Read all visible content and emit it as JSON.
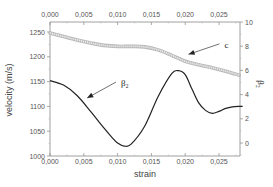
{
  "chart_data": {
    "type": "line",
    "title": "",
    "xlabel": "strain",
    "ylabel": "velocity (m/s)",
    "y2label": "β₂",
    "xlim": [
      0,
      0.0285
    ],
    "ylim": [
      1000,
      1270
    ],
    "y2lim": [
      -1,
      10
    ],
    "xticks": [
      0.0,
      0.005,
      0.01,
      0.015,
      0.02,
      0.025
    ],
    "xtick_labels": [
      "0,000",
      "0,005",
      "0,010",
      "0,015",
      "0,020",
      "0,025"
    ],
    "yticks": [
      1000,
      1050,
      1100,
      1150,
      1200,
      1250
    ],
    "ytick_labels": [
      "1000",
      "1050",
      "1100",
      "1150",
      "1200",
      "1250"
    ],
    "y2ticks": [
      0,
      2,
      4,
      6,
      8,
      10
    ],
    "y2tick_labels": [
      "0",
      "2",
      "4",
      "6",
      "8",
      "10"
    ],
    "grid": false,
    "series": [
      {
        "name": "c",
        "axis": "left",
        "color": "#c8c8c8",
        "style": "thick-hollow",
        "x": [
          0.0,
          0.002,
          0.004,
          0.006,
          0.008,
          0.01,
          0.012,
          0.014,
          0.016,
          0.018,
          0.02,
          0.022,
          0.024,
          0.026,
          0.028
        ],
        "y": [
          1248,
          1241,
          1234,
          1228,
          1223,
          1221,
          1221,
          1220,
          1214,
          1203,
          1191,
          1184,
          1178,
          1171,
          1163
        ]
      },
      {
        "name": "β₂",
        "axis": "left",
        "color": "#222222",
        "style": "solid",
        "x": [
          0.0,
          0.002,
          0.004,
          0.006,
          0.008,
          0.009,
          0.01,
          0.011,
          0.012,
          0.014,
          0.016,
          0.018,
          0.019,
          0.02,
          0.021,
          0.022,
          0.023,
          0.024,
          0.025,
          0.026,
          0.027,
          0.028,
          0.0285
        ],
        "y": [
          1152,
          1143,
          1122,
          1090,
          1056,
          1040,
          1026,
          1020,
          1024,
          1060,
          1120,
          1166,
          1172,
          1164,
          1135,
          1107,
          1092,
          1086,
          1090,
          1096,
          1099,
          1100,
          1100
        ]
      }
    ],
    "annotations": [
      {
        "text": "c",
        "target_series": "c",
        "arrow_to": [
          0.0205,
          1205
        ],
        "text_at": [
          0.0258,
          1222
        ]
      },
      {
        "text": "β₂",
        "target_series": "β₂",
        "arrow_to": [
          0.0055,
          1117
        ],
        "text_at": [
          0.0105,
          1145
        ]
      }
    ]
  }
}
